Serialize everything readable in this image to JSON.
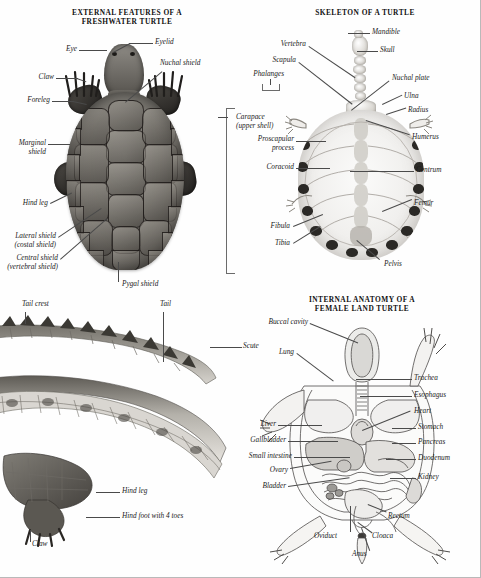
{
  "plate": {
    "background_color": "#fefefe",
    "label_color": "#1b1b1b",
    "leader_color": "#4a4a4a"
  },
  "panels": {
    "external_features": {
      "title_line1": "EXTERNAL FEATURES OF A",
      "title_line2": "FRESHWATER TURTLE",
      "labels": {
        "eyelid": "Eyelid",
        "eye": "Eye",
        "nuchal_shield": "Nuchal shield",
        "claw": "Claw",
        "foreleg": "Foreleg",
        "marginal_shield_line1": "Marginal",
        "marginal_shield_line2": "shield",
        "hind_leg": "Hind leg",
        "lateral_shield_line1": "Lateral shield",
        "lateral_shield_line2": "(costal shield)",
        "central_shield_line1": "Central shield",
        "central_shield_line2": "(vertebral shield)",
        "pygal_shield": "Pygal shield",
        "carapace_line1": "Carapace",
        "carapace_line2": "(upper shell)"
      }
    },
    "skeleton": {
      "title_line1": "SKELETON OF A TURTLE",
      "labels": {
        "mandible": "Mandible",
        "skull": "Skull",
        "vertebra": "Vertebra",
        "scapula": "Scapula",
        "phalanges": "Phalanges",
        "nuchal_plate": "Nuchal plate",
        "ulna": "Ulna",
        "radius": "Radius",
        "humerus": "Humerus",
        "centrum": "Centrum",
        "femur": "Femur",
        "pelvis": "Pelvis",
        "proscapular_line1": "Proscapular",
        "proscapular_line2": "process",
        "coracoid": "Coracoid",
        "fibula": "Fibula",
        "tibia": "Tibia"
      }
    },
    "crocodilian": {
      "labels": {
        "tail_crest": "Tail crest",
        "tail": "Tail",
        "scute": "Scute",
        "hind_leg": "Hind leg",
        "hind_foot": "Hind foot with 4 toes",
        "claw": "Claw"
      }
    },
    "internal_anatomy": {
      "title_line1": "INTERNAL ANATOMY OF A",
      "title_line2": "FEMALE LAND TURTLE",
      "labels": {
        "buccal_cavity": "Buccal cavity",
        "lung": "Lung",
        "liver": "Liver",
        "gallbladder": "Gallbladder",
        "small_intestine": "Small intestine",
        "ovary": "Ovary",
        "bladder": "Bladder",
        "oviduct": "Oviduct",
        "anus": "Anus",
        "cloaca": "Cloaca",
        "rectum": "Rectum",
        "kidney": "Kidney",
        "duodenum": "Duodenum",
        "pancreas": "Pancreas",
        "stomach": "Stomach",
        "heart": "Heart",
        "esophagus": "Esophagus",
        "trachea": "Trachea"
      }
    }
  }
}
